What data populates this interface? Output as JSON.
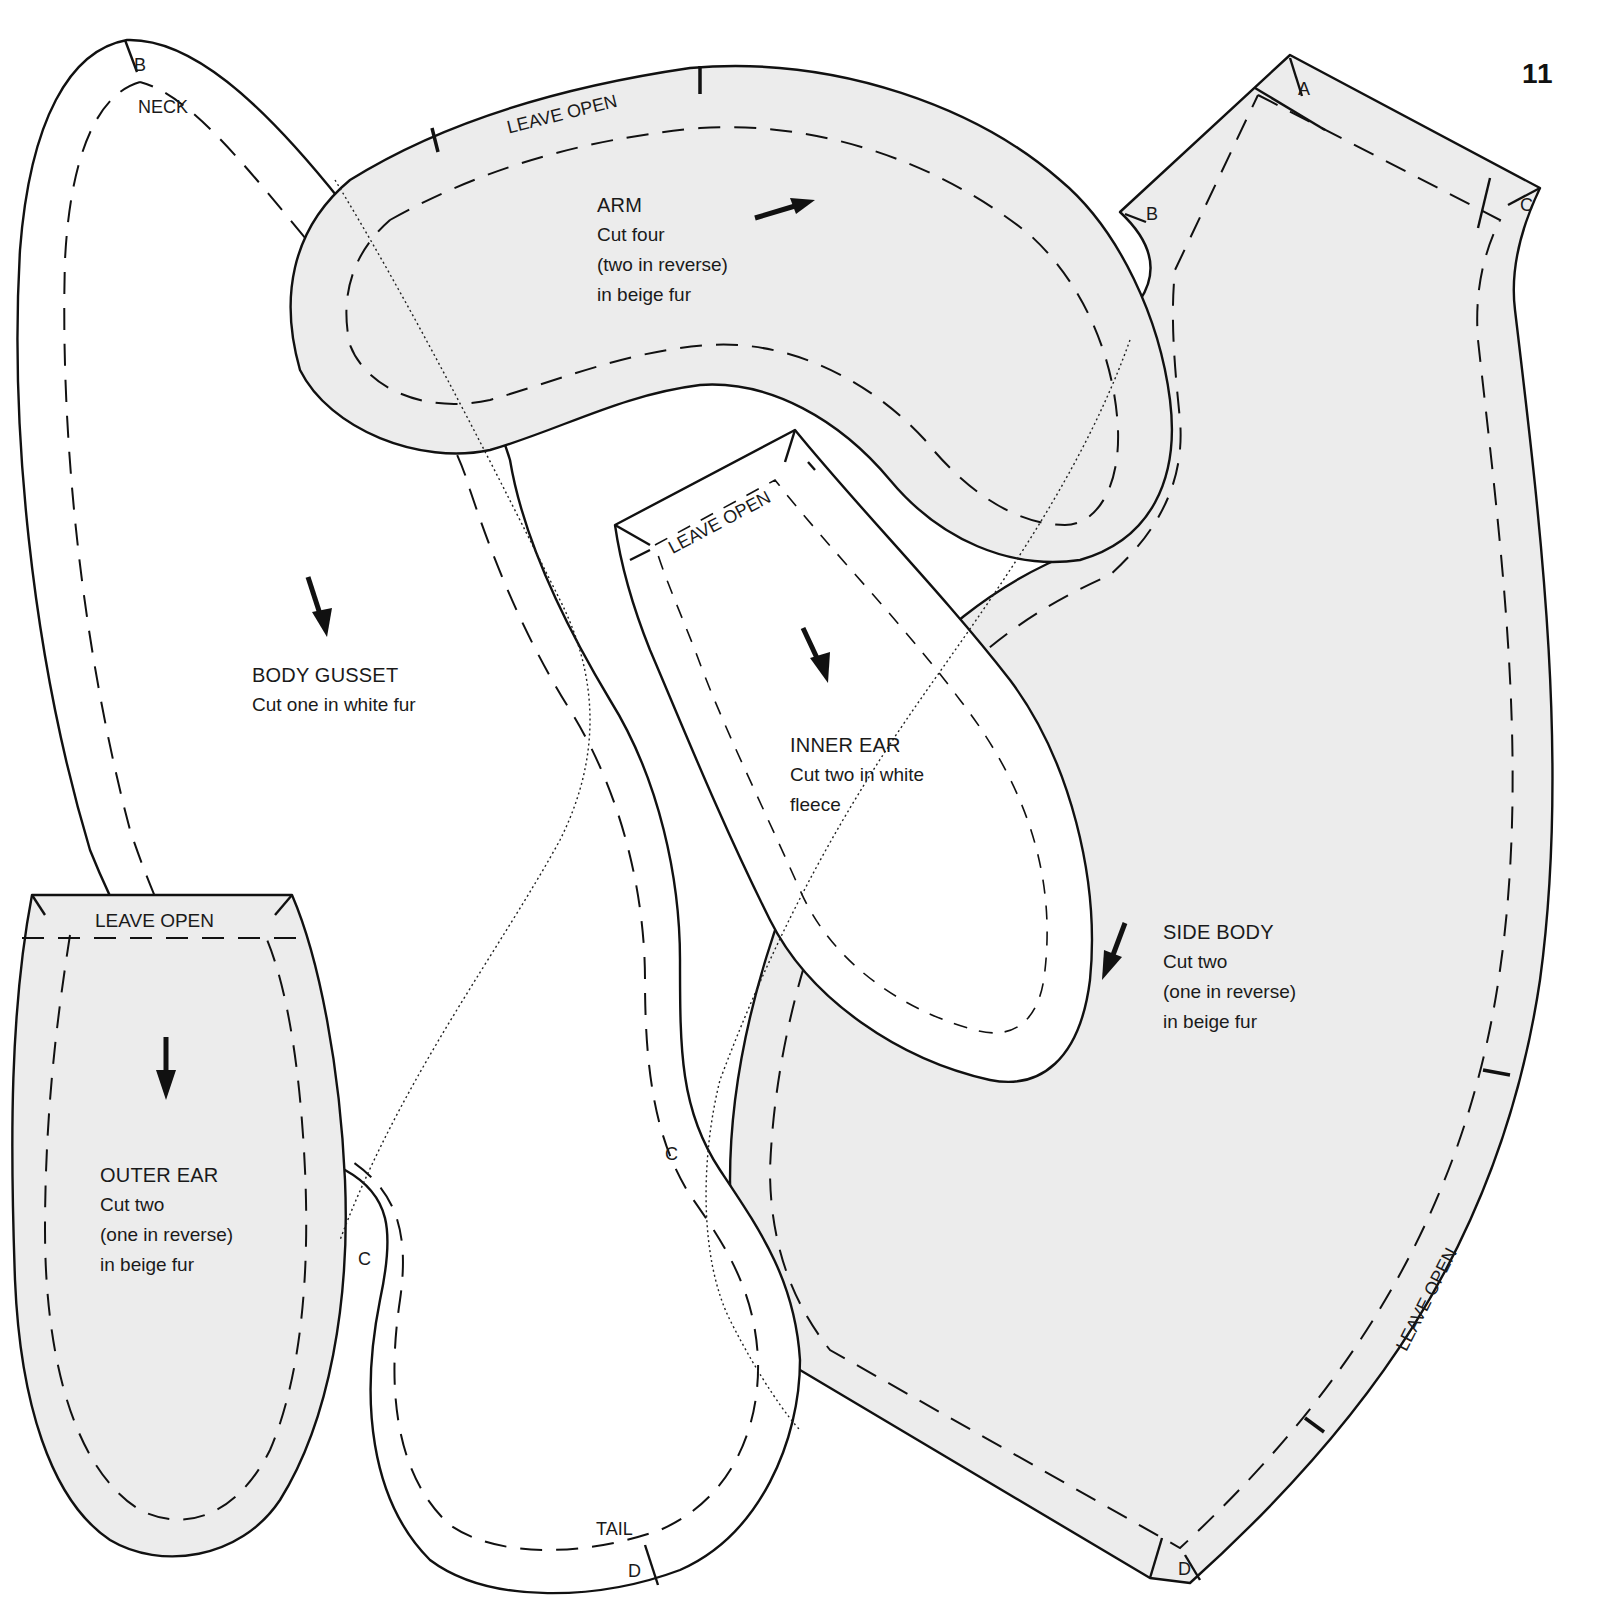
{
  "page": {
    "number": "11",
    "background": "#ffffff",
    "colors": {
      "beige_fur": "#ececec",
      "white_fur": "#ffffff",
      "line": "#111111"
    }
  },
  "pieces": {
    "body_gusset": {
      "title": "BODY GUSSET",
      "instructions": [
        "Cut one in white fur"
      ],
      "fabric_color": "#ffffff",
      "grain_arrow": "down-right",
      "marks": {
        "neck": "NECK",
        "tail": "TAIL",
        "b": "B",
        "c": "C",
        "d": "D"
      }
    },
    "arm": {
      "title": "ARM",
      "instructions": [
        "Cut four",
        "(two in reverse)",
        "in beige fur"
      ],
      "fabric_color": "#ececec",
      "grain_arrow": "right",
      "leave_open": "LEAVE OPEN"
    },
    "inner_ear": {
      "title": "INNER EAR",
      "instructions": [
        "Cut two in white",
        "fleece"
      ],
      "fabric_color": "#ffffff",
      "grain_arrow": "down-right",
      "leave_open": "LEAVE OPEN"
    },
    "outer_ear": {
      "title": "OUTER EAR",
      "instructions": [
        "Cut two",
        "(one in reverse)",
        "in beige fur"
      ],
      "fabric_color": "#ececec",
      "grain_arrow": "down",
      "leave_open": "LEAVE OPEN"
    },
    "side_body": {
      "title": "SIDE BODY",
      "instructions": [
        "Cut two",
        "(one in reverse)",
        "in beige fur"
      ],
      "fabric_color": "#ececec",
      "grain_arrow": "down-left",
      "leave_open": "LEAVE OPEN",
      "marks": {
        "a": "A",
        "b": "B",
        "c": "C",
        "d": "D"
      }
    }
  }
}
